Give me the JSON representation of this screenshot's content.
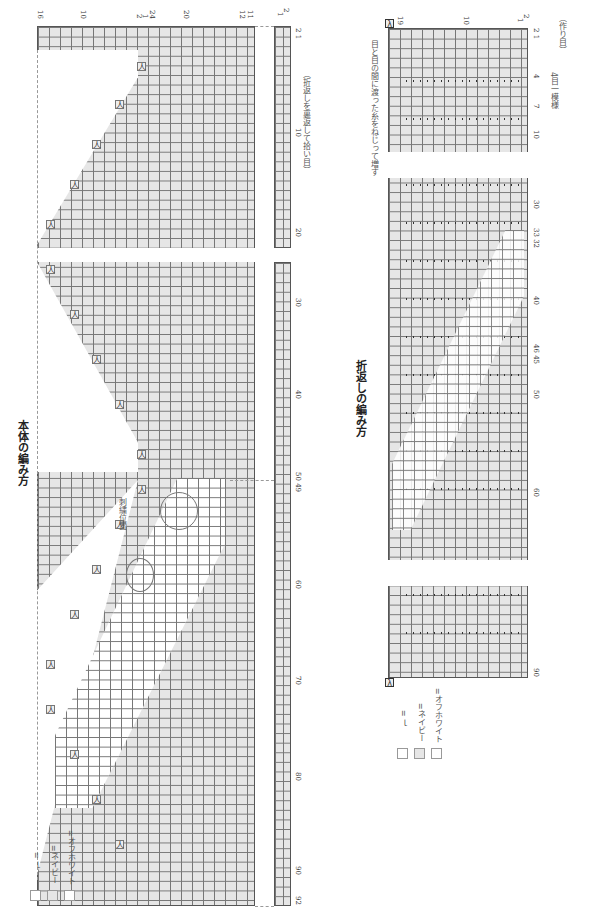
{
  "body_chart": {
    "title": "本体の編み方",
    "annotation": "刺繍位置",
    "pickup_note": "（折返しを裏返して拾い目）",
    "top_labels": [
      "16",
      "10",
      "2",
      "1",
      "24",
      "20",
      "12",
      "11"
    ],
    "row_labels": [
      "2",
      "1"
    ],
    "bottom_labels": [
      "2 1",
      "10",
      "20",
      "30",
      "40",
      "50 49",
      "60",
      "70",
      "80",
      "90",
      "92"
    ],
    "decrease_symbol": "人"
  },
  "fold_chart": {
    "title": "折返しの編み方",
    "increase_note": "目と目の間に渡った糸をねじって増す",
    "cast_on_note": "（作り目）",
    "repeat_note": "4目一模様",
    "top_labels": [
      "2",
      "1",
      "19",
      "10",
      "2",
      "1"
    ],
    "bottom_labels": [
      "2 1",
      "4",
      "7",
      "10",
      "30",
      "33 32",
      "40",
      "46 45",
      "50",
      "60",
      "90"
    ],
    "increase_symbol": "λ"
  },
  "legend": {
    "items": [
      {
        "swatch": "blank",
        "label": "= ｌ"
      },
      {
        "swatch": "navy",
        "label": "=ネイビー"
      },
      {
        "swatch": "offwhite",
        "label": "=オフホワイト"
      }
    ]
  },
  "colors": {
    "navy_cell": "#e6e6e6",
    "offwhite_cell": "#ffffff",
    "grid_line": "#777777"
  }
}
